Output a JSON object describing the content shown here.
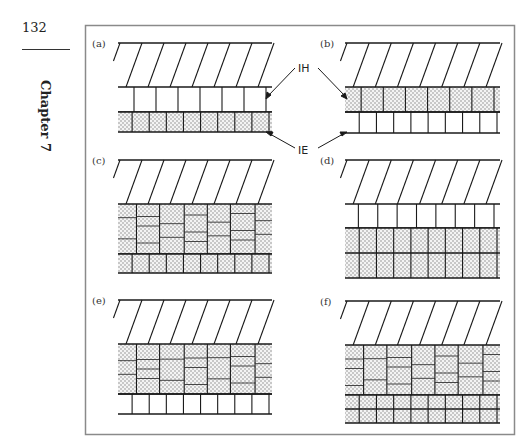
{
  "page": {
    "number": "132",
    "chapter": "Chapter 7"
  },
  "figure": {
    "panels": [
      {
        "id": "a",
        "label": "(a)",
        "layers": [
          "hatched-substrate",
          "IE-single-row",
          "IH-single-row-dotted"
        ]
      },
      {
        "id": "b",
        "label": "(b)",
        "layers": [
          "hatched-substrate",
          "IH-single-row-dotted",
          "IE-single-row"
        ]
      },
      {
        "id": "c",
        "label": "(c)",
        "layers": [
          "hatched-substrate",
          "IH-multilayer-dotted",
          "IE-single-row-dotted"
        ]
      },
      {
        "id": "d",
        "label": "(d)",
        "layers": [
          "hatched-substrate",
          "IE-single-row",
          "IH-multilayer-dotted"
        ]
      },
      {
        "id": "e",
        "label": "(e)",
        "layers": [
          "hatched-substrate",
          "IH-multilayer-dotted",
          "IE-single-row"
        ]
      },
      {
        "id": "f",
        "label": "(f)",
        "layers": [
          "hatched-substrate",
          "IH-multilayer-dotted",
          "IE-multilayer-dotted"
        ]
      }
    ],
    "callouts": {
      "ih": "IH",
      "ie": "IE"
    }
  },
  "colors": {
    "line": "#1a1a1a",
    "frame": "#8a8a8a",
    "dot": "#7a7a7a",
    "fill": "#f2f2f2"
  }
}
